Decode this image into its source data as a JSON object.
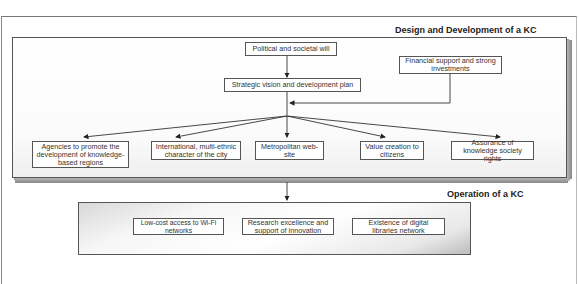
{
  "diagram": {
    "design_section": {
      "title": "Design and Development of a KC",
      "nodes": {
        "political_will": "Political and societal will",
        "financial_support": "Financial support and strong investments",
        "strategic_vision": "Strategic vision and development plan",
        "agencies": "Agencies to promote the development of knowledge-based regions",
        "international": "International, multi-ethnic character of the city",
        "metropolitan": "Metropolitan web-site",
        "value_creation": "Value creation to citizens",
        "assurance": "Assurance of knowledge society rights"
      }
    },
    "operation_section": {
      "title": "Operation of a KC",
      "nodes": {
        "wifi": "Low-cost access to Wi-Fi networks",
        "research": "Research excellence and support of innovation",
        "digital_libraries": "Existence of digital libraries network"
      }
    },
    "edges": [
      {
        "from": "political_will",
        "to": "strategic_vision"
      },
      {
        "from": "financial_support",
        "to": "strategic_vision"
      },
      {
        "from": "strategic_vision",
        "to": "agencies"
      },
      {
        "from": "strategic_vision",
        "to": "international"
      },
      {
        "from": "strategic_vision",
        "to": "metropolitan"
      },
      {
        "from": "strategic_vision",
        "to": "value_creation"
      },
      {
        "from": "strategic_vision",
        "to": "assurance"
      },
      {
        "from": "design_section",
        "to": "operation_section"
      }
    ]
  }
}
